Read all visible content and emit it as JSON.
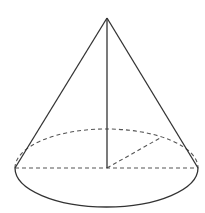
{
  "diagram": {
    "type": "geometry",
    "colors": {
      "line": "#333333",
      "dashed": "#555555",
      "background": "#ffffff"
    },
    "apex": {
      "x": 107,
      "y": 18
    },
    "base_center": {
      "x": 107,
      "y": 168
    },
    "base_ellipse": {
      "rx": 91.5,
      "ry": 39
    },
    "base_left": {
      "x": 15,
      "y": 168
    },
    "base_right": {
      "x": 198,
      "y": 168
    },
    "radius_end": {
      "x": 160,
      "y": 138
    },
    "labels": []
  }
}
